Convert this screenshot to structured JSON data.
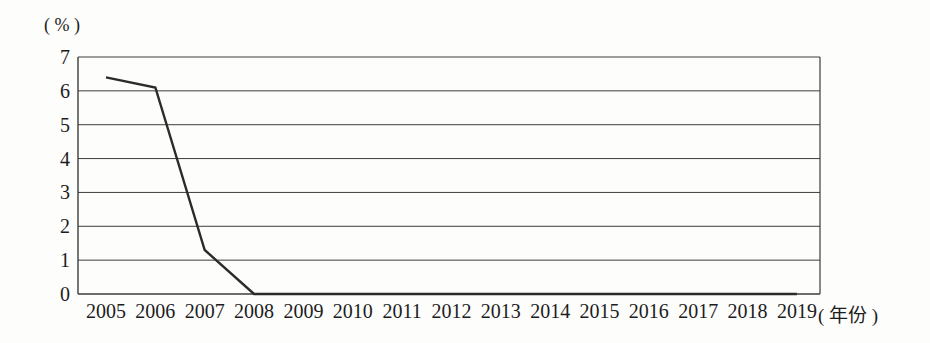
{
  "figure": {
    "y_unit_label": "( % )",
    "x_unit_label": "( 年份 )"
  },
  "chart_data": {
    "type": "line",
    "title": "",
    "categories": [
      "2005",
      "2006",
      "2007",
      "2008",
      "2009",
      "2010",
      "2011",
      "2012",
      "2013",
      "2014",
      "2015",
      "2016",
      "2017",
      "2018",
      "2019"
    ],
    "values": [
      6.4,
      6.1,
      1.3,
      0,
      0,
      0,
      0,
      0,
      0,
      0,
      0,
      0,
      0,
      0,
      0
    ],
    "xlabel": "年份",
    "ylabel": "%",
    "ylim": [
      0,
      7
    ],
    "yticks": [
      0,
      1,
      2,
      3,
      4,
      5,
      6,
      7
    ],
    "grid": "horizontal",
    "legend": "none",
    "line_color": "#2b2b2b",
    "axis_color": "#3c3c3c",
    "background": "#fdfdfc"
  }
}
